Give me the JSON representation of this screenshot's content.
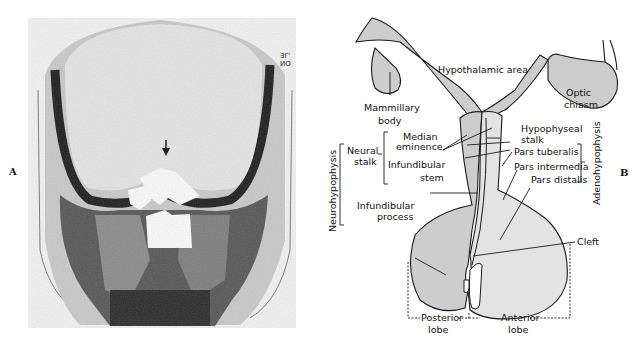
{
  "panels": {
    "a": {
      "label": "A",
      "film_marker": [
        "ƎΓ'",
        "ИO"
      ]
    },
    "b": {
      "label": "B"
    }
  },
  "diagram": {
    "labels": {
      "hypothalamic_area": "Hypothalamic area",
      "mammillary_1": "Mammillary",
      "mammillary_2": "body",
      "optic_1": "Optic",
      "optic_2": "chiasm",
      "median_1": "Median",
      "median_2": "eminence",
      "neural_1": "Neural",
      "neural_2": "stalk",
      "infund_stem_1": "Infundibular",
      "infund_stem_2": "stem",
      "infund_proc_1": "Infundibular",
      "infund_proc_2": "process",
      "hypophyseal_1": "Hypophyseal",
      "hypophyseal_2": "stalk",
      "pars_tuberalis": "Pars tuberalis",
      "pars_intermedia": "Pars intermedia",
      "pars_distalis": "Pars distalis",
      "cleft": "Cleft",
      "posterior_1": "Posterior",
      "posterior_2": "lobe",
      "anterior_1": "Anterior",
      "anterior_2": "lobe",
      "neurohypophysis": "Neurohypophysis",
      "adenohypophysis": "Adenohypophysis"
    },
    "colors": {
      "fill_light": "#e3e3e3",
      "fill_mid": "#cdcdcd",
      "stroke": "#1a1a1a"
    }
  }
}
